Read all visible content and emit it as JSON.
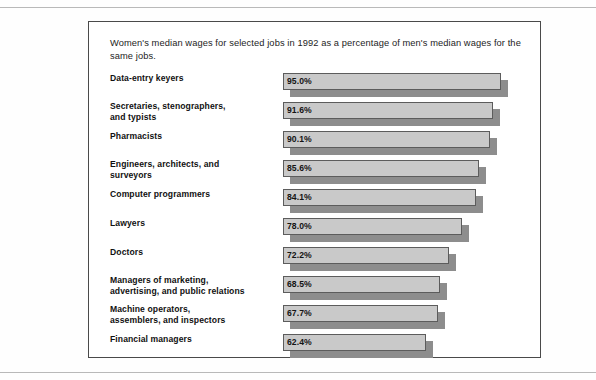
{
  "figure": {
    "caption": "Women's median wages for selected jobs in 1992 as a percentage of men's median wages for the same jobs.",
    "colors": {
      "bar_face": "#c9c9c9",
      "bar_shadow": "#8d8d8d",
      "bar_outline": "#5c5c5c",
      "frame": "#4a4a4a",
      "text": "#111111",
      "background": "#ffffff"
    }
  },
  "chart_data": {
    "type": "bar",
    "orientation": "horizontal",
    "title": "Women's median wages for selected jobs in 1992 as a percentage of men's median wages for the same jobs.",
    "xlabel": "",
    "ylabel": "",
    "grid": false,
    "legend": "none",
    "xlim": [
      0,
      100
    ],
    "unit": "%",
    "categories": [
      "Data-entry keyers",
      "Secretaries, stenographers, and  typists",
      "Pharmacists",
      "Engineers, architects, and surveyors",
      "Computer programmers",
      "Lawyers",
      "Doctors",
      "Managers of marketing, advertising, and public relations",
      "Machine operators, assemblers, and inspectors",
      "Financial managers"
    ],
    "values": [
      95.0,
      91.6,
      90.1,
      85.6,
      84.1,
      78.0,
      72.2,
      68.5,
      67.7,
      62.4
    ],
    "value_labels": [
      "95.0%",
      "91.6%",
      "90.1%",
      "85.6%",
      "84.1%",
      "78.0%",
      "72.2%",
      "68.5%",
      "67.7%",
      "62.4%"
    ],
    "bars": [
      {
        "label_line1": "Data-entry keyers",
        "label_line2": "",
        "value": 95.0,
        "value_label": "95.0%"
      },
      {
        "label_line1": "Secretaries, stenographers,",
        "label_line2": "and  typists",
        "value": 91.6,
        "value_label": "91.6%"
      },
      {
        "label_line1": "Pharmacists",
        "label_line2": "",
        "value": 90.1,
        "value_label": "90.1%"
      },
      {
        "label_line1": "Engineers, architects, and",
        "label_line2": "surveyors",
        "value": 85.6,
        "value_label": "85.6%"
      },
      {
        "label_line1": "Computer programmers",
        "label_line2": "",
        "value": 84.1,
        "value_label": "84.1%"
      },
      {
        "label_line1": "Lawyers",
        "label_line2": "",
        "value": 78.0,
        "value_label": "78.0%"
      },
      {
        "label_line1": "Doctors",
        "label_line2": "",
        "value": 72.2,
        "value_label": "72.2%"
      },
      {
        "label_line1": "Managers of marketing,",
        "label_line2": "advertising, and public relations",
        "value": 68.5,
        "value_label": "68.5%"
      },
      {
        "label_line1": "Machine operators,",
        "label_line2": "assemblers, and inspectors",
        "value": 67.7,
        "value_label": "67.7%"
      },
      {
        "label_line1": "Financial managers",
        "label_line2": "",
        "value": 62.4,
        "value_label": "62.4%"
      }
    ]
  }
}
